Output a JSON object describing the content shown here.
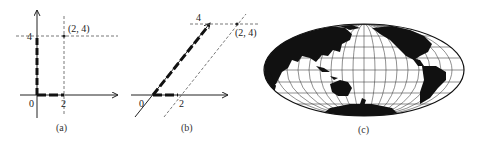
{
  "figure": {
    "panels": [
      {
        "id": "a",
        "caption": "(a)",
        "description": "Standard Cartesian axes with dashed vectors along axes",
        "origin_label": "0",
        "x_tick_label": "2",
        "y_tick_label": "4",
        "point_label": "(2, 4)"
      },
      {
        "id": "b",
        "caption": "(b)",
        "description": "Skewed (oblique) axes with dashed vectors along axes",
        "origin_label": "0",
        "x_tick_label": "2",
        "y_tick_label": "4",
        "point_label": "(2, 4)"
      },
      {
        "id": "c",
        "caption": "(c)",
        "description": "World map in elliptical (Hammer/Aitoff-style) projection centered on the Pacific with graticule"
      }
    ],
    "colors": {
      "ink": "#222222",
      "land": "#111111",
      "ocean": "#ffffff",
      "grid": "#444444"
    }
  }
}
